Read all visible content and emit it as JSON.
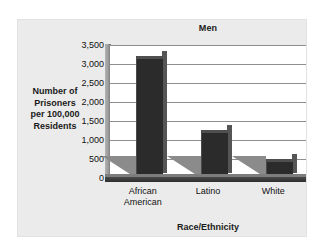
{
  "chart_data": {
    "type": "bar",
    "title": "Men",
    "xlabel": "Race/Ethnicity",
    "ylabel": "Number of Prisoners per 100,000 Residents",
    "ylabel_lines": [
      "Number of",
      "Prisoners",
      "per 100,000",
      "Residents"
    ],
    "categories": [
      "African American",
      "Latino",
      "White"
    ],
    "category_lines": [
      [
        "African",
        "American"
      ],
      [
        "Latino"
      ],
      [
        "White"
      ]
    ],
    "values": [
      3200,
      1250,
      500
    ],
    "ylim": [
      0,
      3500
    ],
    "ytick_values": [
      3500,
      3000,
      2500,
      2000,
      1500,
      1000,
      500,
      0
    ],
    "ytick_labels": [
      "3,500",
      "3,000",
      "2,500",
      "2,000",
      "1,500",
      "1,000",
      "500",
      "0"
    ],
    "grid": true,
    "legend": null,
    "style": {
      "bar_color": "#2b2b2b",
      "bar_side_color": "#555555",
      "bar_top_color": "#4f4f4f",
      "shadow_color": "#8b8b8b",
      "panel_color": "#ebebeb",
      "plot_background": "#ffffff",
      "gridline_color": "#8e8e8e",
      "axis_color": "#2e2e2e",
      "text_color": "#111111"
    }
  }
}
